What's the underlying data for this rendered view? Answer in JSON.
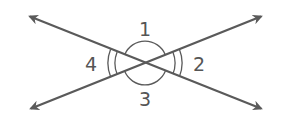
{
  "figure": {
    "type": "intersecting-lines-vertical-angles",
    "line_color": "#5a5a5a",
    "label_color": "#555555",
    "intersection": {
      "x": 145,
      "y": 63
    },
    "lines": [
      {
        "name": "line-a",
        "from": {
          "x": 26,
          "y": 15
        },
        "to": {
          "x": 265,
          "y": 110
        },
        "arrows": "both"
      },
      {
        "name": "line-b",
        "from": {
          "x": 27,
          "y": 110
        },
        "to": {
          "x": 265,
          "y": 15
        },
        "arrows": "both"
      }
    ],
    "angles": [
      {
        "id": "1",
        "label": "1",
        "position": "top",
        "marks": "single-arc"
      },
      {
        "id": "2",
        "label": "2",
        "position": "right",
        "marks": "double-arc"
      },
      {
        "id": "3",
        "label": "3",
        "position": "bottom",
        "marks": "single-arc"
      },
      {
        "id": "4",
        "label": "4",
        "position": "left",
        "marks": "double-arc"
      }
    ]
  }
}
